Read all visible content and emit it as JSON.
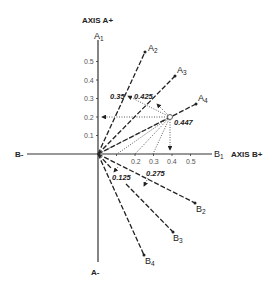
{
  "diagram": {
    "axis_labels": {
      "a_plus": "AXIS A+",
      "a_minus": "A-",
      "b_plus": "AXIS B+",
      "b_minus": "B-"
    },
    "vectors_a": [
      {
        "name": "A",
        "sub": "1"
      },
      {
        "name": "A",
        "sub": "2"
      },
      {
        "name": "A",
        "sub": "3"
      },
      {
        "name": "A",
        "sub": "4"
      }
    ],
    "vectors_b": [
      {
        "name": "B",
        "sub": "1"
      },
      {
        "name": "B",
        "sub": "2"
      },
      {
        "name": "B",
        "sub": "3"
      },
      {
        "name": "B",
        "sub": "4"
      }
    ],
    "a_ticks": [
      "0.1",
      "0.2",
      "0.3",
      "0.4",
      "0.5"
    ],
    "b_ticks": [
      "0.2",
      "0.3",
      "0.4",
      "0.5"
    ],
    "projection_values": {
      "p1": "0.35",
      "p2": "0.425",
      "p3": "0.447",
      "p4": "0.125",
      "p5": "0.275"
    },
    "point": {
      "b": 0.4,
      "a": 0.2
    }
  }
}
